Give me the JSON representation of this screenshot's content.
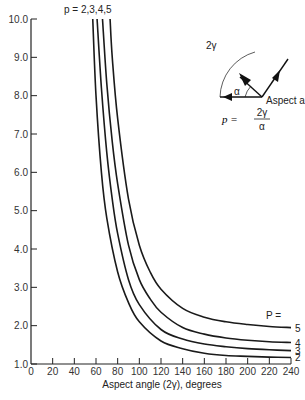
{
  "chart_data": {
    "type": "line",
    "title": "",
    "xlabel": "Aspect angle (2γ), degrees",
    "ylabel": "",
    "xlim": [
      0,
      240
    ],
    "ylim": [
      1.0,
      10.0
    ],
    "xticks": [
      0,
      20,
      40,
      60,
      80,
      100,
      120,
      140,
      160,
      180,
      200,
      220,
      240
    ],
    "xtick_labels": [
      "0",
      "20",
      "40",
      "60",
      "80",
      "100",
      "120",
      "140",
      "160",
      "180",
      "200",
      "220",
      "240"
    ],
    "yticks": [
      1,
      2,
      3,
      4,
      5,
      6,
      7,
      8,
      9,
      10
    ],
    "ytick_labels": [
      "1.0",
      "2.0",
      "3.0",
      "4.0",
      "5.0",
      "6.0",
      "7.0",
      "8.0",
      "9.0",
      "10.0"
    ],
    "grid": false,
    "top_label": "p = 2,3,4,5",
    "legend_title": "P =",
    "series": [
      {
        "name": "2",
        "x": [
          57,
          60,
          65,
          70,
          80,
          90,
          100,
          120,
          140,
          160,
          180,
          200,
          220,
          240
        ],
        "y": [
          10.0,
          8.0,
          6.0,
          4.8,
          3.4,
          2.6,
          2.1,
          1.6,
          1.4,
          1.28,
          1.22,
          1.2,
          1.18,
          1.17
        ]
      },
      {
        "name": "3",
        "x": [
          61,
          65,
          70,
          75,
          80,
          90,
          100,
          120,
          140,
          160,
          180,
          200,
          220,
          240
        ],
        "y": [
          10.0,
          8.2,
          6.5,
          5.3,
          4.4,
          3.2,
          2.55,
          1.9,
          1.65,
          1.52,
          1.45,
          1.4,
          1.37,
          1.35
        ]
      },
      {
        "name": "4",
        "x": [
          66,
          70,
          75,
          80,
          90,
          100,
          110,
          120,
          140,
          160,
          180,
          200,
          220,
          240
        ],
        "y": [
          10.0,
          8.3,
          6.8,
          5.7,
          4.1,
          3.2,
          2.7,
          2.35,
          1.95,
          1.78,
          1.68,
          1.62,
          1.58,
          1.56
        ]
      },
      {
        "name": "5",
        "x": [
          73,
          75,
          80,
          90,
          100,
          110,
          120,
          140,
          160,
          180,
          200,
          220,
          240
        ],
        "y": [
          10.0,
          9.0,
          7.4,
          5.3,
          4.1,
          3.4,
          2.95,
          2.45,
          2.22,
          2.1,
          2.03,
          1.98,
          1.95
        ]
      }
    ],
    "inset": {
      "angle_label": "2γ",
      "alpha_label": "α",
      "arrow_label": "Aspect angle",
      "formula_lhs": "p =",
      "formula_num": "2γ",
      "formula_den": "α"
    }
  }
}
